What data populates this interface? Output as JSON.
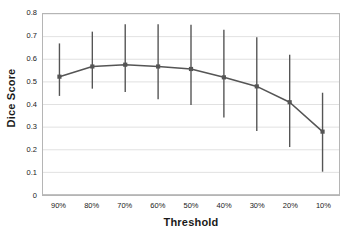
{
  "chart_data": {
    "type": "line",
    "title": "",
    "xlabel": "Threshold",
    "ylabel": "Dice Score",
    "categories": [
      "90%",
      "80%",
      "70%",
      "60%",
      "50%",
      "40%",
      "30%",
      "20%",
      "10%"
    ],
    "values": [
      0.523,
      0.568,
      0.576,
      0.568,
      0.557,
      0.52,
      0.48,
      0.41,
      0.28
    ],
    "error_low": [
      0.438,
      0.47,
      0.455,
      0.423,
      0.398,
      0.343,
      0.283,
      0.212,
      0.103
    ],
    "error_high": [
      0.67,
      0.722,
      0.755,
      0.755,
      0.752,
      0.73,
      0.697,
      0.62,
      0.452
    ],
    "ylim": [
      0,
      0.8
    ],
    "ytick_labels": [
      "0",
      "0.1",
      "0.2",
      "0.3",
      "0.4",
      "0.5",
      "0.6",
      "0.7",
      "0.8"
    ],
    "ytick_values": [
      0,
      0.1,
      0.2,
      0.3,
      0.4,
      0.5,
      0.6,
      0.7,
      0.8
    ],
    "grid": true,
    "grid_axis": "y",
    "legend": false,
    "legend_position": "none",
    "series_color": "#555555",
    "marker": "square",
    "errorbar_color": "#555555",
    "gridline_color": "#d9d9d9",
    "axis_color": "#808080",
    "plot_border_color": "#b5b5b5",
    "background_color": "#ffffff"
  }
}
